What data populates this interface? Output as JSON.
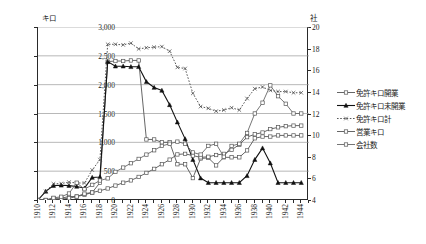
{
  "axes": {
    "left_unit": "キロ",
    "right_unit": "社",
    "left_ticks": [
      "0",
      "500",
      "1,000",
      "1,500",
      "2,000",
      "2,500",
      "3,000"
    ],
    "right_ticks": [
      "4",
      "6",
      "8",
      "10",
      "12",
      "14",
      "16",
      "18",
      "20"
    ],
    "x_ticks": [
      "1910",
      "1912",
      "1914",
      "1916",
      "1918",
      "1920",
      "1922",
      "1924",
      "1926",
      "1928",
      "1930",
      "1932",
      "1934",
      "1936",
      "1938",
      "1940",
      "1942",
      "1944"
    ]
  },
  "legend": {
    "items": [
      {
        "label": "免許キロ開業",
        "marker": "open-square",
        "line": "solid"
      },
      {
        "label": "免許キロ未開業",
        "marker": "filled-triangle",
        "line": "solid"
      },
      {
        "label": "免許キロ計",
        "marker": "x-mark",
        "line": "dotted"
      },
      {
        "label": "営業キロ",
        "marker": "open-square",
        "line": "solid"
      },
      {
        "label": "会社数",
        "marker": "open-square",
        "line": "solid"
      }
    ]
  },
  "chart_data": {
    "type": "line",
    "title": "",
    "xlabel": "",
    "ylabel": "キロ",
    "y2label": "社",
    "xlim": [
      1910,
      1945
    ],
    "ylim": [
      0,
      3000
    ],
    "y2lim": [
      4,
      20
    ],
    "grid": true,
    "legend_position": "right",
    "x": [
      1910,
      1911,
      1912,
      1913,
      1914,
      1915,
      1916,
      1917,
      1918,
      1919,
      1920,
      1921,
      1922,
      1923,
      1924,
      1925,
      1926,
      1927,
      1928,
      1929,
      1930,
      1931,
      1932,
      1933,
      1934,
      1935,
      1936,
      1937,
      1938,
      1939,
      1940,
      1941,
      1942,
      1943,
      1944
    ],
    "series": [
      {
        "name": "免許キロ開業",
        "axis": "left",
        "values": [
          0,
          0,
          30,
          30,
          60,
          60,
          90,
          130,
          300,
          2400,
          2410,
          2410,
          2420,
          2420,
          1050,
          1050,
          1000,
          1000,
          620,
          620,
          380,
          720,
          730,
          600,
          740,
          740,
          740,
          860,
          1070,
          1100,
          1100,
          1120,
          1120,
          1120,
          1120
        ]
      },
      {
        "name": "免許キロ未開業",
        "axis": "left",
        "values": [
          0,
          150,
          250,
          255,
          250,
          235,
          205,
          390,
          400,
          2400,
          2320,
          2320,
          2310,
          2310,
          2050,
          1950,
          1900,
          1650,
          1350,
          1060,
          700,
          380,
          300,
          300,
          300,
          300,
          300,
          420,
          700,
          900,
          640,
          300,
          300,
          300,
          300
        ]
      },
      {
        "name": "免許キロ計",
        "axis": "left",
        "values": [
          0,
          150,
          280,
          285,
          310,
          295,
          295,
          520,
          700,
          2700,
          2700,
          2690,
          2720,
          2620,
          2640,
          2650,
          2660,
          2580,
          2300,
          2280,
          1850,
          1620,
          1590,
          1540,
          1560,
          1600,
          1560,
          1760,
          1930,
          1960,
          1900,
          1880,
          1880,
          1860,
          1860
        ]
      },
      {
        "name": "営業キロ",
        "axis": "left",
        "values": [
          0,
          0,
          10,
          15,
          30,
          60,
          110,
          130,
          160,
          200,
          250,
          300,
          340,
          400,
          470,
          540,
          620,
          700,
          790,
          800,
          770,
          740,
          750,
          780,
          800,
          870,
          960,
          1090,
          1140,
          1170,
          1230,
          1260,
          1280,
          1290,
          1290
        ]
      },
      {
        "name": "会社数",
        "axis": "right",
        "values": [
          4,
          4,
          4.2,
          4.3,
          4.6,
          5.6,
          5.0,
          5.4,
          5.8,
          6.0,
          6.6,
          7.0,
          7.4,
          7.8,
          8.2,
          8.6,
          9.0,
          9.2,
          9.4,
          9.2,
          8.4,
          8.2,
          9.0,
          9.2,
          8.0,
          9.0,
          9.2,
          10.2,
          12.0,
          13.0,
          14.6,
          13.6,
          12.9,
          12.0,
          12.0
        ]
      }
    ]
  }
}
